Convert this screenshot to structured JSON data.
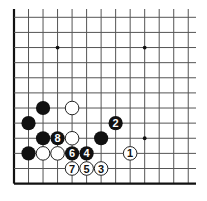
{
  "diagram": {
    "type": "go-board-fragment",
    "columns": 13,
    "rows": 12,
    "origin_x": 14,
    "origin_y": 17.3,
    "spacing_x": 14.52,
    "spacing_y": 15.12,
    "line_top_extend": 9,
    "line_right_extend": 196,
    "left_edge_thick": true,
    "bottom_edge_thick": true,
    "colors": {
      "background": "#ffffff",
      "grid": "#555555",
      "edge": "#111111",
      "black_stone": "#111111",
      "white_stone_fill": "#ffffff",
      "white_stone_stroke": "#222222",
      "black_label": "#ffffff",
      "white_label": "#111111"
    },
    "star_points": [
      {
        "col": 3,
        "row": 2
      },
      {
        "col": 9,
        "row": 2
      },
      {
        "col": 9,
        "row": 8
      }
    ],
    "stones": [
      {
        "color": "black",
        "col": 2,
        "row": 6,
        "label": ""
      },
      {
        "color": "white",
        "col": 4,
        "row": 6,
        "label": ""
      },
      {
        "color": "black",
        "col": 1,
        "row": 7,
        "label": ""
      },
      {
        "color": "black",
        "col": 7,
        "row": 7,
        "label": "2"
      },
      {
        "color": "black",
        "col": 2,
        "row": 8,
        "label": ""
      },
      {
        "color": "black",
        "col": 3,
        "row": 8,
        "label": "8"
      },
      {
        "color": "white",
        "col": 4,
        "row": 8,
        "label": ""
      },
      {
        "color": "black",
        "col": 6,
        "row": 8,
        "label": ""
      },
      {
        "color": "black",
        "col": 1,
        "row": 9,
        "label": ""
      },
      {
        "color": "white",
        "col": 2,
        "row": 9,
        "label": ""
      },
      {
        "color": "white",
        "col": 3,
        "row": 9,
        "label": ""
      },
      {
        "color": "black",
        "col": 4,
        "row": 9,
        "label": "6"
      },
      {
        "color": "black",
        "col": 5,
        "row": 9,
        "label": "4"
      },
      {
        "color": "white",
        "col": 8,
        "row": 9,
        "label": "1"
      },
      {
        "color": "white",
        "col": 4,
        "row": 10,
        "label": "7"
      },
      {
        "color": "white",
        "col": 5,
        "row": 10,
        "label": "5"
      },
      {
        "color": "white",
        "col": 6,
        "row": 10,
        "label": "3"
      }
    ]
  }
}
